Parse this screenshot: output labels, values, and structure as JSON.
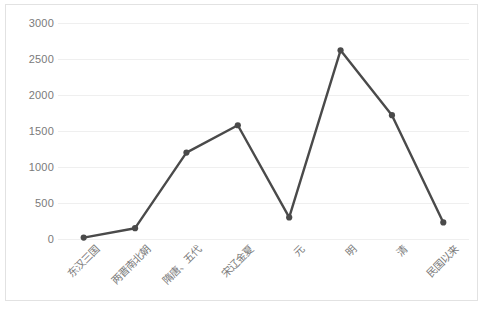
{
  "chart_data": {
    "type": "line",
    "title": "",
    "subtitle": "",
    "xlabel": "",
    "ylabel": "",
    "categories": [
      "东汉三国",
      "两晋南北朝",
      "隋唐、五代",
      "宋辽金夏",
      "元",
      "明",
      "清",
      "民国以来"
    ],
    "values": [
      20,
      150,
      1200,
      1580,
      300,
      2620,
      1720,
      230
    ],
    "series": [
      {
        "name": "",
        "values": [
          20,
          150,
          1200,
          1580,
          300,
          2620,
          1720,
          230
        ]
      }
    ],
    "ylim": [
      0,
      3000
    ],
    "ytick_labels": [
      "3000",
      "2500",
      "2000",
      "1500",
      "1000",
      "500",
      "0"
    ],
    "ytick_values": [
      3000,
      2500,
      2000,
      1500,
      1000,
      500,
      0
    ],
    "grid": true,
    "legend": "none",
    "marker": "circle",
    "line_color": "#4a4a4a",
    "marker_color": "#4a4a4a",
    "grid_color": "#efefef",
    "tick_label_color": "#7a7a7a",
    "border_color": "#e2e2e2",
    "background_color": "#ffffff",
    "x_label_rotation_deg": -45
  }
}
